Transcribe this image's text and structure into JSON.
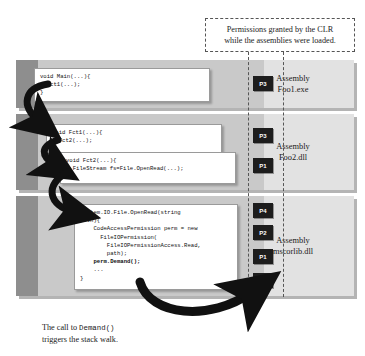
{
  "callout": {
    "line1": "Permissions granted by the CLR",
    "line2": "while the assemblies were loaded."
  },
  "assemblies": [
    {
      "label_top": "Assembly",
      "label_bottom": "Foo1.exe",
      "badges": [
        "P3"
      ],
      "code": "void Main(...){\n  Fct1(...);\n}"
    },
    {
      "label_top": "Assembly",
      "label_bottom": "Foo2.dll",
      "badges": [
        "P3",
        "P1"
      ],
      "code_1": "void Fct1(...){\n  Fct2(...);\n}",
      "code_2": "void Fct2(...){\n  FileStream fs=File.OpenRead(...);\n}"
    },
    {
      "label_top": "Assembly",
      "label_bottom": "mscorlib.dll",
      "badges": [
        "P4",
        "P2",
        "P1",
        "P3"
      ],
      "code_head": "System.IO.File.OpenRead(string\npath){\n    CodeAccessPermission perm = new\n      FileIOPermission(\n        FileIOPermissionAccess.Read,\n        path);\n    ",
      "code_bold": "perm.Demand();",
      "code_tail": "\n    ...\n}"
    }
  ],
  "caption": {
    "before": "The call to ",
    "mono": "Demand()",
    "after": "",
    "line2": "triggers the stack walk."
  },
  "colors": {
    "band_dark": "#8e8e8e",
    "band_mid": "#c9c9c9",
    "band_light": "#e2e2e2",
    "badge_bg": "#1d1d1d",
    "arrow": "#111111"
  }
}
